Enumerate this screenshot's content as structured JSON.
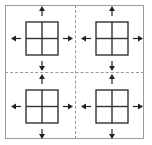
{
  "diagram": {
    "title": "",
    "layout": "2x2",
    "colors": {
      "frame": "#9a9a9a",
      "divider": "#9a9a9a",
      "grid": "#333333",
      "arrow": "#222222"
    },
    "cells": [
      {
        "id": "top-left",
        "grid": "2x2",
        "arrows": [
          "up",
          "down",
          "left",
          "right"
        ]
      },
      {
        "id": "top-right",
        "grid": "2x2",
        "arrows": [
          "up",
          "down",
          "left",
          "right"
        ]
      },
      {
        "id": "bottom-left",
        "grid": "2x2",
        "arrows": [
          "up",
          "down",
          "left",
          "right"
        ]
      },
      {
        "id": "bottom-right",
        "grid": "2x2",
        "arrows": [
          "up",
          "down",
          "left",
          "right"
        ]
      }
    ]
  }
}
